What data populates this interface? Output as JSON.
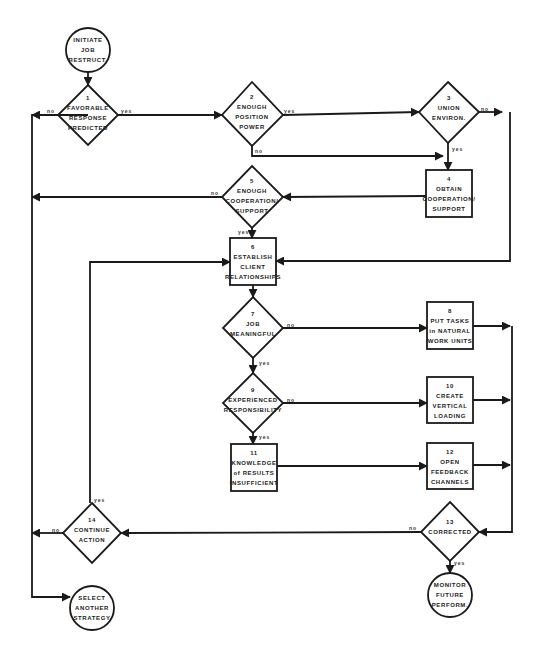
{
  "diagram": {
    "type": "flowchart",
    "colors": {
      "line": "#1a1a1a",
      "text": "#222222",
      "background": "#ffffff"
    },
    "nodes": {
      "start": {
        "shape": "circle",
        "lines": [
          "INITIATE",
          "JOB",
          "RESTRUCT."
        ]
      },
      "n1": {
        "shape": "diamond",
        "num": "1",
        "lines": [
          "FAVORABLE",
          "RESPONSE",
          "PREDICTED"
        ]
      },
      "n2": {
        "shape": "diamond",
        "num": "2",
        "lines": [
          "ENOUGH",
          "POSITION",
          "POWER"
        ]
      },
      "n3": {
        "shape": "diamond",
        "num": "3",
        "lines": [
          "UNION",
          "ENVIRON."
        ]
      },
      "n4": {
        "shape": "box",
        "num": "4",
        "lines": [
          "OBTAIN",
          "COOPERATION/",
          "SUPPORT"
        ]
      },
      "n5": {
        "shape": "diamond",
        "num": "5",
        "lines": [
          "ENOUGH",
          "COOPERATION/",
          "SUPPORT"
        ]
      },
      "n6": {
        "shape": "box",
        "num": "6",
        "lines": [
          "ESTABLISH",
          "CLIENT",
          "RELATIONSHIPS"
        ]
      },
      "n7": {
        "shape": "diamond",
        "num": "7",
        "lines": [
          "JOB",
          "MEANINGFUL"
        ]
      },
      "n8": {
        "shape": "box",
        "num": "8",
        "lines": [
          "PUT TASKS",
          "in NATURAL",
          "WORK UNITS"
        ]
      },
      "n9": {
        "shape": "diamond",
        "num": "9",
        "lines": [
          "EXPERIENCED",
          "RESPONSIBILITY"
        ]
      },
      "n10": {
        "shape": "box",
        "num": "10",
        "lines": [
          "CREATE",
          "VERTICAL",
          "LOADING"
        ]
      },
      "n11": {
        "shape": "box",
        "num": "11",
        "lines": [
          "KNOWLEDGE",
          "of RESULTS",
          "INSUFFICIENT"
        ]
      },
      "n12": {
        "shape": "box",
        "num": "12",
        "lines": [
          "OPEN",
          "FEEDBACK",
          "CHANNELS"
        ]
      },
      "n13": {
        "shape": "diamond",
        "num": "13",
        "lines": [
          "CORRECTED"
        ]
      },
      "n14": {
        "shape": "diamond",
        "num": "14",
        "lines": [
          "CONTINUE",
          "ACTION"
        ]
      },
      "end_monitor": {
        "shape": "circle",
        "lines": [
          "MONITOR",
          "FUTURE",
          "PERFORM."
        ]
      },
      "end_select": {
        "shape": "circle",
        "lines": [
          "SELECT",
          "ANOTHER",
          "STRATEGY"
        ]
      }
    },
    "edge_labels": {
      "n1_no": "no",
      "n1_yes": "yes",
      "n2_yes": "yes",
      "n2_no": "no",
      "n3_no": "no",
      "n3_yes": "yes",
      "n5_no": "no",
      "n5_yes": "yes",
      "n7_no": "no",
      "n7_yes": "yes",
      "n9_no": "no",
      "n9_yes": "yes",
      "n13_no": "no",
      "n13_yes": "yes",
      "n14_no": "no",
      "n14_yes": "yes"
    },
    "edges": [
      [
        "start",
        "n1",
        ""
      ],
      [
        "n1",
        "n2",
        "yes"
      ],
      [
        "n1",
        "end_select",
        "no"
      ],
      [
        "n2",
        "n3",
        "yes"
      ],
      [
        "n2",
        "n4",
        "no"
      ],
      [
        "n3",
        "n4",
        "yes"
      ],
      [
        "n3",
        "n6",
        "no"
      ],
      [
        "n4",
        "n5",
        ""
      ],
      [
        "n5",
        "n6",
        "yes"
      ],
      [
        "n5",
        "end_select",
        "no"
      ],
      [
        "n6",
        "n7",
        ""
      ],
      [
        "n7",
        "n8",
        "no"
      ],
      [
        "n7",
        "n9",
        "yes"
      ],
      [
        "n9",
        "n10",
        "no"
      ],
      [
        "n9",
        "n11",
        "yes"
      ],
      [
        "n11",
        "n12",
        ""
      ],
      [
        "n8",
        "n13",
        ""
      ],
      [
        "n10",
        "n13",
        ""
      ],
      [
        "n12",
        "n13",
        ""
      ],
      [
        "n13",
        "end_monitor",
        "yes"
      ],
      [
        "n13",
        "n14",
        "no"
      ],
      [
        "n14",
        "n6",
        "yes"
      ],
      [
        "n14",
        "end_select",
        "no"
      ]
    ]
  }
}
